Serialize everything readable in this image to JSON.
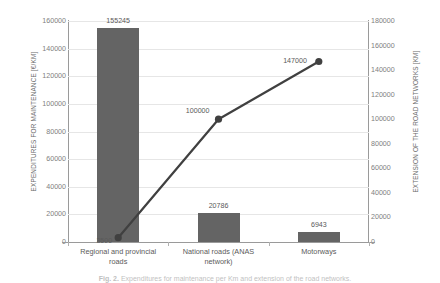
{
  "chart_data": {
    "type": "bar",
    "title": "",
    "categories": [
      "Regional and provincial roads",
      "National roads (ANAS network)",
      "Motorways"
    ],
    "series": [
      {
        "name": "Expenditures for maintenance",
        "type": "bar",
        "axis": "left",
        "values": [
          155245,
          20786,
          6943
        ],
        "color": "#646464"
      },
      {
        "name": "Extension of the road networks",
        "type": "line",
        "axis": "right",
        "values": [
          3500,
          100000,
          147000
        ],
        "color": "#404040"
      }
    ],
    "xlabel": "",
    "ylabel": "EXPENDITURES FOR MAINTENANCE [€/KM]",
    "y2label": "EXTENSION OF THE ROAD NETWORKS [KM]",
    "ylim": [
      0,
      160000
    ],
    "y2lim": [
      0,
      180000
    ],
    "ytick_step": 20000,
    "y2tick_step": 20000,
    "yticks": [
      "0",
      "20000",
      "40000",
      "60000",
      "80000",
      "100000",
      "120000",
      "140000",
      "160000"
    ],
    "y2ticks": [
      "0",
      "20000",
      "40000",
      "60000",
      "80000",
      "100000",
      "120000",
      "140000",
      "160000",
      "180000"
    ],
    "grid": true,
    "legend": "none",
    "data_labels": {
      "bars": [
        "155245",
        "20786",
        "6943"
      ],
      "line": [
        "3500",
        "100000",
        "147000"
      ]
    }
  },
  "caption": {
    "label": "Fig. 2.",
    "text": "Expenditures for maintenance per Km and extension of the road networks."
  }
}
